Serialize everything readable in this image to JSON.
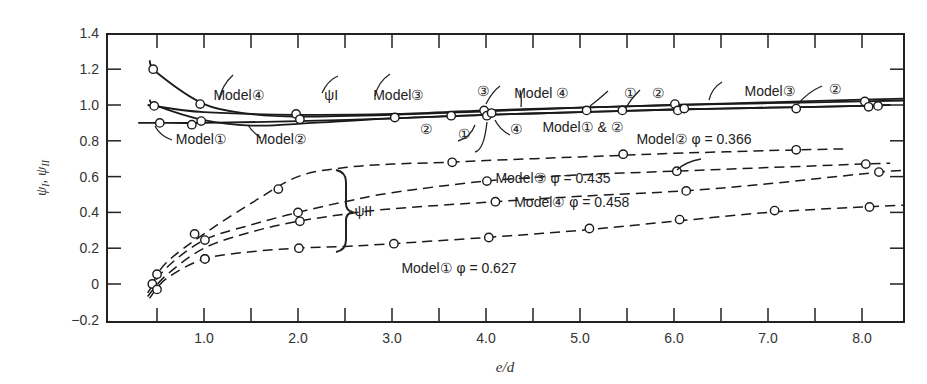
{
  "chart_data": {
    "type": "line",
    "title": "",
    "xlabel": "e/d",
    "ylabel": "ψ_I, ψ_II",
    "xlim": [
      0,
      8.5
    ],
    "ylim": [
      -0.2,
      1.4
    ],
    "x_ticks": [
      0.5,
      1.0,
      1.5,
      2.0,
      2.5,
      3.0,
      3.5,
      4.0,
      4.5,
      5.0,
      5.5,
      6.0,
      6.5,
      7.0,
      7.5,
      8.0
    ],
    "x_tick_labels": [
      "1.0",
      "2.0",
      "3.0",
      "4.0",
      "5.0",
      "6.0",
      "7.0",
      "8.0"
    ],
    "y_ticks": [
      -0.2,
      0,
      0.2,
      0.4,
      0.6,
      0.8,
      1.0,
      1.2,
      1.4
    ],
    "y_tick_labels": [
      "−0.2",
      "0",
      "0.2",
      "0.4",
      "0.6",
      "0.8",
      "1.0",
      "1.2",
      "1.4"
    ],
    "grid": false,
    "legend": "none (inline annotations)",
    "series": [
      {
        "name": "ψ_I Model ④",
        "style": "solid",
        "curve": [
          [
            0.42,
            1.25
          ],
          [
            0.5,
            1.18
          ],
          [
            1.0,
            1.005
          ],
          [
            1.5,
            0.95
          ],
          [
            2.0,
            0.935
          ],
          [
            3.0,
            0.945
          ],
          [
            4.0,
            0.965
          ],
          [
            5.0,
            0.985
          ],
          [
            6.0,
            1.0
          ],
          [
            7.0,
            1.01
          ],
          [
            8.0,
            1.02
          ],
          [
            8.45,
            1.025
          ]
        ],
        "points": [
          [
            0.46,
            1.2
          ],
          [
            0.96,
            1.005
          ],
          [
            3.63,
            0.94
          ],
          [
            3.98,
            0.97
          ]
        ]
      },
      {
        "name": "ψ_I Model ③",
        "style": "solid",
        "curve": [
          [
            0.4,
            1.0
          ],
          [
            1.0,
            0.96
          ],
          [
            2.0,
            0.945
          ],
          [
            3.0,
            0.95
          ],
          [
            4.0,
            0.97
          ],
          [
            5.0,
            0.985
          ],
          [
            6.0,
            1.0
          ],
          [
            7.0,
            1.015
          ],
          [
            8.0,
            1.03
          ],
          [
            8.45,
            1.035
          ]
        ],
        "points": [
          [
            1.98,
            0.95
          ],
          [
            6.01,
            1.005
          ],
          [
            8.03,
            1.02
          ]
        ]
      },
      {
        "name": "ψ_I Model ②",
        "style": "solid",
        "curve": [
          [
            0.42,
            1.03
          ],
          [
            0.5,
            0.995
          ],
          [
            1.0,
            0.915
          ],
          [
            1.5,
            0.885
          ],
          [
            2.0,
            0.895
          ],
          [
            3.0,
            0.925
          ],
          [
            4.0,
            0.945
          ],
          [
            5.0,
            0.96
          ],
          [
            6.0,
            0.975
          ],
          [
            7.0,
            0.985
          ],
          [
            8.0,
            0.995
          ],
          [
            8.3,
            1.0
          ]
        ],
        "points": [
          [
            0.47,
            0.995
          ],
          [
            0.97,
            0.91
          ],
          [
            3.03,
            0.93
          ],
          [
            4.01,
            0.94
          ],
          [
            5.45,
            0.97
          ],
          [
            7.3,
            0.98
          ],
          [
            8.17,
            0.995
          ]
        ]
      },
      {
        "name": "ψ_I Model ①",
        "style": "solid",
        "curve": [
          [
            0.3,
            0.9
          ],
          [
            0.5,
            0.9
          ],
          [
            1.0,
            0.9
          ],
          [
            2.0,
            0.91
          ],
          [
            3.0,
            0.925
          ],
          [
            4.0,
            0.945
          ],
          [
            5.0,
            0.96
          ],
          [
            6.0,
            0.975
          ],
          [
            7.0,
            0.985
          ],
          [
            8.0,
            0.995
          ],
          [
            8.3,
            1.0
          ]
        ],
        "points": [
          [
            0.53,
            0.9
          ],
          [
            0.87,
            0.89
          ],
          [
            2.02,
            0.92
          ],
          [
            4.06,
            0.955
          ],
          [
            5.07,
            0.97
          ],
          [
            6.04,
            0.97
          ],
          [
            6.11,
            0.98
          ],
          [
            8.07,
            0.99
          ]
        ]
      },
      {
        "name": "ψ_II Model ② φ = 0.366",
        "style": "dashed",
        "curve": [
          [
            0.45,
            0.0
          ],
          [
            0.6,
            0.12
          ],
          [
            1.0,
            0.28
          ],
          [
            1.5,
            0.45
          ],
          [
            2.0,
            0.6
          ],
          [
            2.5,
            0.65
          ],
          [
            3.0,
            0.67
          ],
          [
            3.6,
            0.68
          ],
          [
            4.0,
            0.69
          ],
          [
            5.0,
            0.71
          ],
          [
            5.5,
            0.72
          ],
          [
            6.0,
            0.73
          ],
          [
            7.0,
            0.745
          ],
          [
            7.8,
            0.755
          ]
        ],
        "points": [
          [
            0.45,
            0.0
          ],
          [
            0.9,
            0.28
          ],
          [
            1.79,
            0.53
          ],
          [
            3.64,
            0.68
          ],
          [
            5.46,
            0.725
          ],
          [
            7.3,
            0.75
          ]
        ]
      },
      {
        "name": "ψ_II Model ③ φ = 0.435",
        "style": "dashed",
        "curve": [
          [
            0.4,
            -0.05
          ],
          [
            0.6,
            0.09
          ],
          [
            1.0,
            0.245
          ],
          [
            1.5,
            0.33
          ],
          [
            2.0,
            0.4
          ],
          [
            2.5,
            0.46
          ],
          [
            3.0,
            0.51
          ],
          [
            4.0,
            0.575
          ],
          [
            5.0,
            0.61
          ],
          [
            6.0,
            0.63
          ],
          [
            7.0,
            0.65
          ],
          [
            8.0,
            0.67
          ],
          [
            8.3,
            0.675
          ]
        ],
        "points": [
          [
            0.5,
            0.055
          ],
          [
            1.01,
            0.245
          ],
          [
            2.0,
            0.4
          ],
          [
            4.01,
            0.575
          ],
          [
            6.03,
            0.63
          ],
          [
            8.04,
            0.67
          ]
        ]
      },
      {
        "name": "ψ_II Model ④ φ = 0.458",
        "style": "dashed",
        "curve": [
          [
            0.4,
            -0.07
          ],
          [
            0.6,
            0.05
          ],
          [
            1.0,
            0.2
          ],
          [
            1.5,
            0.29
          ],
          [
            2.0,
            0.35
          ],
          [
            2.5,
            0.39
          ],
          [
            3.0,
            0.42
          ],
          [
            4.1,
            0.46
          ],
          [
            5.0,
            0.49
          ],
          [
            6.1,
            0.52
          ],
          [
            7.0,
            0.56
          ],
          [
            8.18,
            0.625
          ],
          [
            8.45,
            0.635
          ]
        ],
        "points": [
          [
            0.5,
            -0.03
          ],
          [
            1.01,
            0.14
          ],
          [
            2.02,
            0.35
          ],
          [
            4.1,
            0.46
          ],
          [
            6.13,
            0.52
          ],
          [
            8.18,
            0.625
          ]
        ]
      },
      {
        "name": "ψ_II Model ① φ = 0.627",
        "style": "dashed",
        "curve": [
          [
            0.42,
            -0.08
          ],
          [
            0.6,
            0.03
          ],
          [
            1.0,
            0.14
          ],
          [
            1.5,
            0.18
          ],
          [
            2.0,
            0.2
          ],
          [
            2.5,
            0.21
          ],
          [
            3.0,
            0.225
          ],
          [
            4.0,
            0.26
          ],
          [
            5.0,
            0.3
          ],
          [
            6.0,
            0.35
          ],
          [
            7.0,
            0.4
          ],
          [
            8.0,
            0.43
          ],
          [
            8.45,
            0.44
          ]
        ],
        "points": [
          [
            1.01,
            0.14
          ],
          [
            2.01,
            0.2
          ],
          [
            3.02,
            0.225
          ],
          [
            4.03,
            0.26
          ],
          [
            5.1,
            0.31
          ],
          [
            6.06,
            0.36
          ],
          [
            7.07,
            0.41
          ],
          [
            8.08,
            0.43
          ]
        ]
      }
    ],
    "annotations": [
      {
        "text": "Model④",
        "x": 1.1,
        "y": 1.03
      },
      {
        "text": "ψI",
        "x": 2.28,
        "y": 1.03
      },
      {
        "text": "Model③",
        "x": 2.8,
        "y": 1.03
      },
      {
        "text": "③",
        "x": 3.9,
        "y": 1.05
      },
      {
        "text": "Model ④",
        "x": 4.3,
        "y": 1.04
      },
      {
        "text": "①",
        "x": 5.47,
        "y": 1.04
      },
      {
        "text": "②",
        "x": 5.77,
        "y": 1.04
      },
      {
        "text": "Model③",
        "x": 6.75,
        "y": 1.05
      },
      {
        "text": "②",
        "x": 7.65,
        "y": 1.06
      },
      {
        "text": "②",
        "x": 3.3,
        "y": 0.84
      },
      {
        "text": "①",
        "x": 3.7,
        "y": 0.81
      },
      {
        "text": "④",
        "x": 4.25,
        "y": 0.84
      },
      {
        "text": "Model① & ②",
        "x": 4.6,
        "y": 0.85
      },
      {
        "text": "Model①",
        "x": 0.7,
        "y": 0.78
      },
      {
        "text": "Model②",
        "x": 1.55,
        "y": 0.78
      },
      {
        "text": "Model② φ = 0.366",
        "x": 5.6,
        "y": 0.78
      },
      {
        "text": "Model③ φ = 0.435",
        "x": 4.1,
        "y": 0.565
      },
      {
        "text": "Model④ φ = 0.458",
        "x": 4.3,
        "y": 0.43
      },
      {
        "text": "Model① φ = 0.627",
        "x": 3.1,
        "y": 0.06
      },
      {
        "text": "ψII",
        "x": 2.6,
        "y": 0.38
      }
    ]
  }
}
